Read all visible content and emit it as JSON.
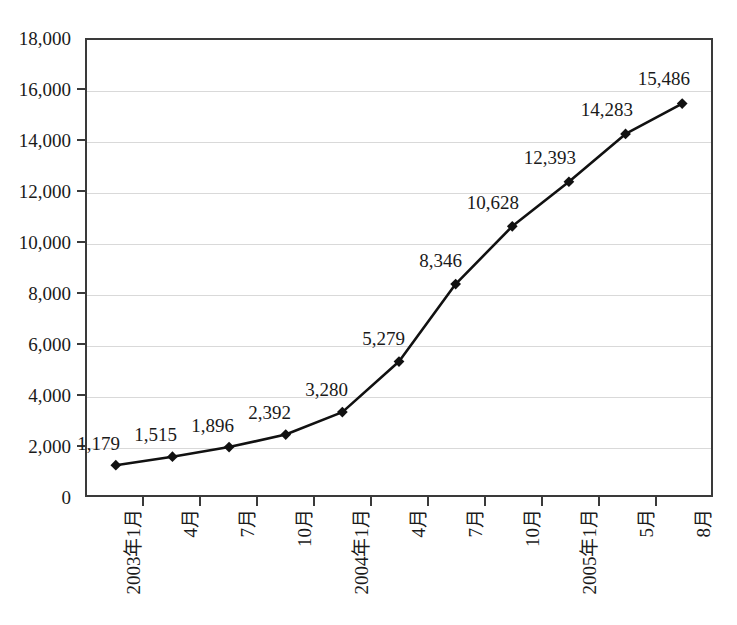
{
  "chart_data": {
    "type": "line",
    "title": "",
    "subtitle": "",
    "xlabel": "",
    "ylabel": "",
    "categories": [
      "2003年1月",
      "4月",
      "7月",
      "10月",
      "2004年1月",
      "4月",
      "7月",
      "10月",
      "2005年1月",
      "5月",
      "8月"
    ],
    "values": [
      1179,
      1515,
      1896,
      2392,
      3280,
      5279,
      8346,
      10628,
      12393,
      14283,
      15486
    ],
    "point_labels": [
      "1,179",
      "1,515",
      "1,896",
      "2,392",
      "3,280",
      "5,279",
      "8,346",
      "10,628",
      "12,393",
      "14,283",
      "15,486"
    ],
    "ylim": [
      0,
      18000
    ],
    "ytick_step": 2000,
    "ytick_labels": [
      "18,000",
      "16,000",
      "14,000",
      "12,000",
      "10,000",
      "8,000",
      "6,000",
      "4,000",
      "2,000",
      "0"
    ],
    "ytick_values": [
      18000,
      16000,
      14000,
      12000,
      10000,
      8000,
      6000,
      4000,
      2000,
      0
    ],
    "grid": true,
    "grid_axis": "y",
    "legend": false,
    "legend_position": "none",
    "series": [
      {
        "name": "",
        "values": [
          1179,
          1515,
          1896,
          2392,
          3280,
          5279,
          8346,
          10628,
          12393,
          14283,
          15486
        ],
        "marker": "diamond",
        "line_color": "#111111",
        "marker_color": "#111111"
      }
    ],
    "annotations": []
  },
  "style": {
    "background_color": "#ffffff",
    "axis_color": "#3a3a3a",
    "grid_color": "#d9d9d9",
    "text_color": "#1a1a1a",
    "line_color": "#111111",
    "marker_color": "#111111"
  }
}
